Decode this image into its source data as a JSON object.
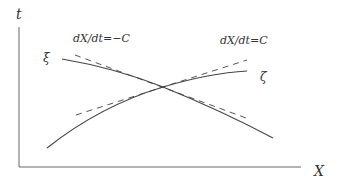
{
  "diagram": {
    "axes": {
      "vertical_label": "t",
      "horizontal_label": "X",
      "color": "#555555"
    },
    "curves": [
      {
        "name": "xi",
        "label": "ξ",
        "description": "descending characteristic curve",
        "color": "#444444"
      },
      {
        "name": "zeta",
        "label": "ζ",
        "description": "ascending characteristic curve",
        "color": "#444444"
      }
    ],
    "tangents": [
      {
        "name": "minus-c",
        "label": "dX/dt=−C",
        "style": "dashed"
      },
      {
        "name": "plus-c",
        "label": "dX/dt=C",
        "style": "dashed"
      }
    ]
  }
}
